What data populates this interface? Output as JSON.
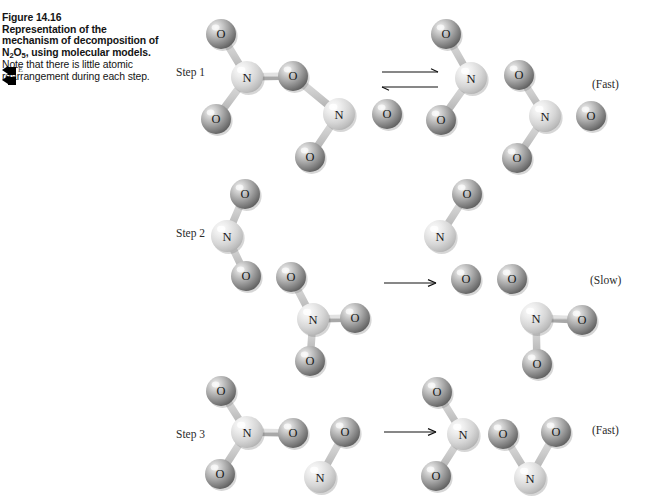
{
  "figure": {
    "number": "Figure 14.16",
    "lead": "Representation of the mechanism of decomposition of N",
    "lead_sub1": "2",
    "lead_mid": "O",
    "lead_sub2": "5",
    "lead_end": ", using molecular models.",
    "note": " Note that there is little atomic rearrangement during each step.",
    "marker_letter": "E"
  },
  "atoms": {
    "oxygen_label": "O",
    "nitrogen_label": "N",
    "oxygen_color": "#9b9b9b",
    "oxygen_highlight": "#e8e8e8",
    "oxygen_shadow": "#5d5d5d",
    "nitrogen_color": "#d2d2d2",
    "nitrogen_highlight": "#f6f6f6",
    "nitrogen_shadow": "#9a9a9a",
    "bond_color": "#c9c9c9"
  },
  "steps": [
    {
      "id": "step-1",
      "label": "Step 1",
      "label_x": 176,
      "label_y": 66,
      "arrow": {
        "type": "equilibrium",
        "x": 382,
        "y": 72,
        "width": 56
      },
      "rate": {
        "text": "(Fast)",
        "x": 592,
        "y": 78
      },
      "reactants": [
        {
          "name": "dinitrogen-pentoxide",
          "formula": "N2O5",
          "atoms": [
            {
              "el": "O",
              "x": 221,
              "y": 34,
              "r": 15
            },
            {
              "el": "N",
              "x": 247,
              "y": 77,
              "r": 16
            },
            {
              "el": "O",
              "x": 216,
              "y": 119,
              "r": 15
            },
            {
              "el": "O",
              "x": 293,
              "y": 76,
              "r": 15
            },
            {
              "el": "N",
              "x": 339,
              "y": 114,
              "r": 16
            },
            {
              "el": "O",
              "x": 310,
              "y": 157,
              "r": 15
            },
            {
              "el": "O",
              "x": 387,
              "y": 114,
              "r": 15
            }
          ],
          "bonds": [
            [
              0,
              1
            ],
            [
              1,
              2
            ],
            [
              1,
              3
            ],
            [
              3,
              4
            ],
            [
              4,
              5
            ],
            [
              4,
              6
            ]
          ]
        }
      ],
      "products": [
        {
          "name": "nitrogen-dioxide",
          "formula": "NO2",
          "atoms": [
            {
              "el": "O",
              "x": 446,
              "y": 34,
              "r": 15
            },
            {
              "el": "N",
              "x": 471,
              "y": 78,
              "r": 16
            },
            {
              "el": "O",
              "x": 441,
              "y": 120,
              "r": 15
            }
          ],
          "bonds": [
            [
              0,
              1
            ],
            [
              1,
              2
            ]
          ]
        },
        {
          "name": "nitrate-radical",
          "formula": "NO3",
          "atoms": [
            {
              "el": "O",
              "x": 519,
              "y": 75,
              "r": 15
            },
            {
              "el": "N",
              "x": 545,
              "y": 116,
              "r": 16
            },
            {
              "el": "O",
              "x": 517,
              "y": 158,
              "r": 15
            },
            {
              "el": "O",
              "x": 591,
              "y": 116,
              "r": 15
            }
          ],
          "bonds": [
            [
              0,
              1
            ],
            [
              1,
              2
            ],
            [
              1,
              3
            ]
          ]
        }
      ]
    },
    {
      "id": "step-2",
      "label": "Step 2",
      "label_x": 176,
      "label_y": 227,
      "arrow": {
        "type": "single",
        "x": 384,
        "y": 283,
        "width": 52
      },
      "rate": {
        "text": "(Slow)",
        "x": 590,
        "y": 274
      },
      "reactants": [
        {
          "name": "nitrogen-dioxide",
          "formula": "NO2",
          "atoms": [
            {
              "el": "O",
              "x": 245,
              "y": 194,
              "r": 15
            },
            {
              "el": "N",
              "x": 227,
              "y": 236,
              "r": 16
            },
            {
              "el": "O",
              "x": 246,
              "y": 276,
              "r": 15
            }
          ],
          "bonds": [
            [
              0,
              1
            ],
            [
              1,
              2
            ]
          ]
        },
        {
          "name": "nitrate-radical",
          "formula": "NO3",
          "atoms": [
            {
              "el": "O",
              "x": 291,
              "y": 277,
              "r": 15
            },
            {
              "el": "N",
              "x": 313,
              "y": 319,
              "r": 16
            },
            {
              "el": "O",
              "x": 310,
              "y": 361,
              "r": 15
            },
            {
              "el": "O",
              "x": 355,
              "y": 318,
              "r": 15
            }
          ],
          "bonds": [
            [
              0,
              1
            ],
            [
              1,
              2
            ],
            [
              1,
              3
            ]
          ]
        }
      ],
      "products": [
        {
          "name": "nitric-oxide",
          "formula": "NO",
          "atoms": [
            {
              "el": "O",
              "x": 467,
              "y": 194,
              "r": 15
            },
            {
              "el": "N",
              "x": 440,
              "y": 236,
              "r": 16
            }
          ],
          "bonds": [
            [
              0,
              1
            ]
          ]
        },
        {
          "name": "dioxygen",
          "formula": "O2",
          "atoms": [
            {
              "el": "O",
              "x": 466,
              "y": 279,
              "r": 15
            },
            {
              "el": "O",
              "x": 512,
              "y": 279,
              "r": 15
            }
          ],
          "bonds": [
            [
              0,
              1
            ]
          ]
        },
        {
          "name": "nitrogen-dioxide",
          "formula": "NO2",
          "atoms": [
            {
              "el": "N",
              "x": 536,
              "y": 318,
              "r": 16
            },
            {
              "el": "O",
              "x": 582,
              "y": 320,
              "r": 15
            },
            {
              "el": "O",
              "x": 537,
              "y": 364,
              "r": 15
            }
          ],
          "bonds": [
            [
              0,
              1
            ],
            [
              0,
              2
            ]
          ]
        }
      ]
    },
    {
      "id": "step-3",
      "label": "Step 3",
      "label_x": 176,
      "label_y": 428,
      "arrow": {
        "type": "single",
        "x": 384,
        "y": 432,
        "width": 52
      },
      "rate": {
        "text": "(Fast)",
        "x": 592,
        "y": 424
      },
      "reactants": [
        {
          "name": "nitrate-radical",
          "formula": "NO3",
          "atoms": [
            {
              "el": "O",
              "x": 221,
              "y": 391,
              "r": 15
            },
            {
              "el": "N",
              "x": 247,
              "y": 432,
              "r": 16
            },
            {
              "el": "O",
              "x": 220,
              "y": 474,
              "r": 15
            },
            {
              "el": "O",
              "x": 293,
              "y": 433,
              "r": 15
            }
          ],
          "bonds": [
            [
              0,
              1
            ],
            [
              1,
              2
            ],
            [
              1,
              3
            ]
          ]
        },
        {
          "name": "nitric-oxide",
          "formula": "NO",
          "atoms": [
            {
              "el": "O",
              "x": 345,
              "y": 432,
              "r": 15
            },
            {
              "el": "N",
              "x": 320,
              "y": 477,
              "r": 16
            }
          ],
          "bonds": [
            [
              0,
              1
            ]
          ]
        }
      ],
      "products": [
        {
          "name": "nitrogen-dioxide",
          "formula": "NO2",
          "atoms": [
            {
              "el": "O",
              "x": 437,
              "y": 392,
              "r": 15
            },
            {
              "el": "N",
              "x": 463,
              "y": 434,
              "r": 16
            },
            {
              "el": "O",
              "x": 436,
              "y": 476,
              "r": 15
            }
          ],
          "bonds": [
            [
              0,
              1
            ],
            [
              1,
              2
            ]
          ]
        },
        {
          "name": "nitrogen-dioxide",
          "formula": "NO2",
          "atoms": [
            {
              "el": "O",
              "x": 503,
              "y": 434,
              "r": 15
            },
            {
              "el": "N",
              "x": 530,
              "y": 478,
              "r": 16
            },
            {
              "el": "O",
              "x": 556,
              "y": 432,
              "r": 15
            }
          ],
          "bonds": [
            [
              0,
              1
            ],
            [
              1,
              2
            ]
          ]
        }
      ]
    }
  ],
  "chart_data": {
    "type": "diagram",
    "mechanism": [
      {
        "step": "Step 1",
        "equation": "N2O5 <=> NO2 + NO3",
        "rate": "(Fast)",
        "arrow": "equilibrium"
      },
      {
        "step": "Step 2",
        "equation": "NO2 + NO3 -> NO + O2 + NO2",
        "rate": "(Slow)",
        "arrow": "single"
      },
      {
        "step": "Step 3",
        "equation": "NO3 + NO -> NO2 + NO2",
        "rate": "(Fast)",
        "arrow": "single"
      }
    ]
  }
}
